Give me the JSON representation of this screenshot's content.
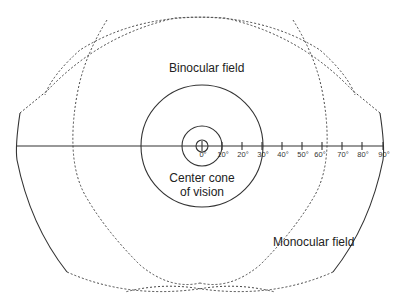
{
  "diagram": {
    "labels": {
      "binocular": "Binocular field",
      "center_line1": "Center cone",
      "center_line2": "of vision",
      "monocular": "Monocular field"
    },
    "axis": {
      "ticks": [
        "0°",
        "10°",
        "20°",
        "30°",
        "40°",
        "50°",
        "60°",
        "70°",
        "80°",
        "90°"
      ],
      "unit": "degrees"
    },
    "colors": {
      "stroke": "#333333",
      "background": "#ffffff"
    }
  }
}
